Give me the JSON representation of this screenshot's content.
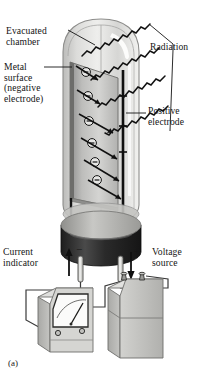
{
  "figure": {
    "caption": "(a)",
    "labels": {
      "evacuated_chamber": "Evacuated\nchamber",
      "metal_surface": "Metal\nsurface\n(negative\nelectrode)",
      "radiation": "Radiation",
      "positive_electrode": "Positive\nelectrode",
      "current_indicator": "Current\nindicator",
      "voltage_source": "Voltage\nsource",
      "terminal_negative": "−",
      "terminal_positive": "+"
    },
    "electron_symbol": "−",
    "electron_count": 6,
    "colors": {
      "ink": "#141414",
      "glass_light": "#e3e3e1",
      "glass_mid": "#cfcfcd",
      "plate_light": "#c9c9c6",
      "plate_dark": "#3a3a3a",
      "base_top": "#b4b4b1",
      "base_body": "#2e2e2e",
      "device_face": "#dcdcda",
      "device_side": "#b9b9b6",
      "device_front": "#c6c6c3",
      "meter_face": "#fbfbfa",
      "wire": "#3c3c3c"
    }
  }
}
